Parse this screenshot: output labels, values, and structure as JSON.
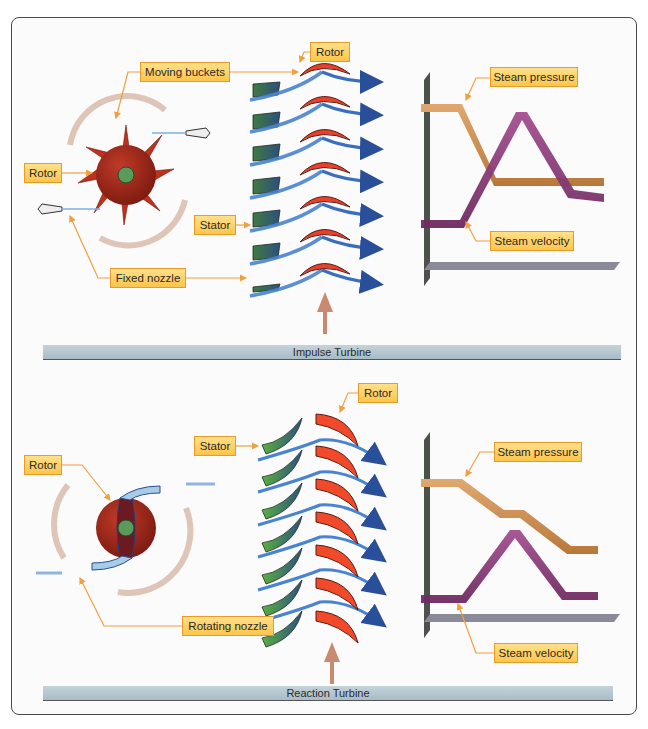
{
  "impulse": {
    "title": "Impulse Turbine",
    "labels": {
      "moving_buckets": "Moving buckets",
      "rotor_left": "Rotor",
      "rotor_top": "Rotor",
      "stator": "Stator",
      "fixed_nozzle": "Fixed nozzle",
      "steam_pressure": "Steam pressure",
      "steam_velocity": "Steam velocity"
    }
  },
  "reaction": {
    "title": "Reaction Turbine",
    "labels": {
      "rotor_left": "Rotor",
      "rotor_top": "Rotor",
      "stator": "Stator",
      "rotating_nozzle": "Rotating nozzle",
      "steam_pressure": "Steam pressure",
      "steam_velocity": "Steam velocity"
    }
  },
  "colors": {
    "label_fill": "#fcc54a",
    "label_border": "#e89a2a",
    "leader_line": "#f0a040",
    "rotor_blade": "#e8402a",
    "stator_blade_impulse": "#3f6e4a",
    "stator_blade_reaction": "#4a9a3a",
    "steam_flow": "#3a6fc0",
    "pressure_ribbon": "#c8884a",
    "velocity_ribbon": "#8a3a78",
    "rotor_disc": "#a82a1a",
    "hub": "#5a9a5a"
  }
}
